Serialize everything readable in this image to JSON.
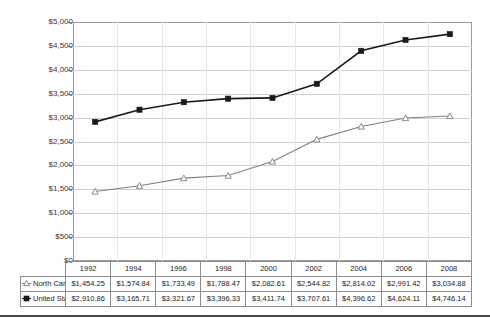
{
  "chart_data": {
    "type": "line",
    "title": "",
    "xlabel": "",
    "ylabel": "",
    "grid": true,
    "legend_position": "table-row-headers",
    "categories": [
      "1992",
      "1994",
      "1996",
      "1998",
      "2000",
      "2002",
      "2004",
      "2006",
      "2008"
    ],
    "ylim": [
      0,
      5000
    ],
    "ytick_values": [
      0,
      500,
      1000,
      1500,
      2000,
      2500,
      3000,
      3500,
      4000,
      4500,
      5000
    ],
    "ytick_labels": [
      "$0",
      "$500",
      "$1,000",
      "$1,500",
      "$2,000",
      "$2,500",
      "$3,000",
      "$3,500",
      "$4,000",
      "$4,500",
      "$5,000"
    ],
    "series": [
      {
        "name": "North Carolina",
        "marker": "open-triangle",
        "color": "#808080",
        "values": [
          1454.25,
          1574.84,
          1733.49,
          1788.47,
          2082.61,
          2544.82,
          2814.02,
          2991.42,
          3034.88
        ],
        "labels": [
          "$1,454.25",
          "$1,574.84",
          "$1,733.49",
          "$1,788.47",
          "$2,082.61",
          "$2,544.82",
          "$2,814.02",
          "$2,991.42",
          "$3,034.88"
        ]
      },
      {
        "name": "United States",
        "marker": "filled-square",
        "color": "#1a1a1a",
        "values": [
          2910.86,
          3165.71,
          3321.67,
          3396.33,
          3411.74,
          3707.61,
          4396.62,
          4624.11,
          4746.14
        ],
        "labels": [
          "$2,910.86",
          "$3,165.71",
          "$3,321.67",
          "$3,396.33",
          "$3,411.74",
          "$3,707.61",
          "$4,396.62",
          "$4,624.11",
          "$4,746.14"
        ]
      }
    ]
  },
  "table": {
    "year_headers": [
      "1992",
      "1994",
      "1996",
      "1998",
      "2000",
      "2002",
      "2004",
      "2006",
      "2008"
    ],
    "rows": [
      {
        "label": "North Carolina",
        "marker": "open-triangle",
        "cells": [
          "$1,454.25",
          "$1,574.84",
          "$1,733.49",
          "$1,788.47",
          "$2,082.61",
          "$2,544.82",
          "$2,814.02",
          "$2,991.42",
          "$3,034.88"
        ]
      },
      {
        "label": "United States",
        "marker": "filled-square",
        "cells": [
          "$2,910.86",
          "$3,165.71",
          "$3,321.67",
          "$3,396.33",
          "$3,411.74",
          "$3,707.61",
          "$4,396.62",
          "$4,624.11",
          "$4,746.14"
        ]
      }
    ]
  },
  "colors": {
    "north_carolina": "#808080",
    "united_states": "#1a1a1a",
    "gridline": "#d0d0d0",
    "frame": "#9a9a9a",
    "rule": "#4a4a4a"
  }
}
